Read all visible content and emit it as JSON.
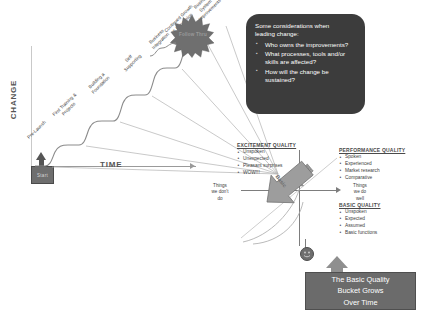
{
  "diagram": {
    "axes": {
      "y_label": "CHANGE",
      "x_label": "TIME",
      "origin_box_label": "Start"
    },
    "stairs": [
      {
        "label": "Pre-Launch"
      },
      {
        "label": "First Training &\nProjects"
      },
      {
        "label": "Building a\nFoundation"
      },
      {
        "label": "Self\nSupporting"
      },
      {
        "label": "Business\nIntegration"
      },
      {
        "label": "Continued Growth\n& Expansion"
      },
      {
        "label": "Business\nSystem\nImprovements"
      }
    ],
    "starburst": {
      "label": "Follow Thru"
    },
    "considerations": {
      "intro": "Some considerations when\nleading change:",
      "items": [
        "Who owns the improvements?",
        "What processes, tools and/or skills are affected?",
        "How will the change be sustained?"
      ]
    },
    "kano": {
      "excitement": {
        "heading": "EXCITEMENT QUALITY",
        "items": [
          "Unspoken",
          "Unexpected",
          "Pleasant surprises",
          "WOW!!!"
        ]
      },
      "performance": {
        "heading": "PERFORMANCE QUALITY",
        "items": [
          "Spoken",
          "Experienced",
          "Market research",
          "Comparative"
        ]
      },
      "basic": {
        "heading": "BASIC QUALITY",
        "items": [
          "Unspoken",
          "Expected",
          "Assumed",
          "Basic functions"
        ]
      },
      "quadrant_left_label": "Things\nwe don't\ndo",
      "quadrant_right_label": "Things\nwe do\nwell",
      "basic_arrow_label": "Basic"
    },
    "bucket": {
      "caption": "The Basic Quality\nBucket Grows\nOver Time"
    },
    "colors": {
      "callout_bg": "#3c3c3c",
      "bucket_bg": "#6b6b6b",
      "star_fill": "#6f6f6f",
      "line": "#9a9a9a",
      "text": "#3d3d3d"
    }
  }
}
